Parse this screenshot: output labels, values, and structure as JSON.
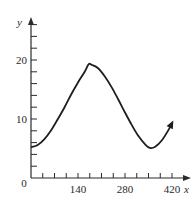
{
  "chart_data": {
    "type": "line",
    "title": "",
    "xlabel": "x",
    "ylabel": "y",
    "xlim": [
      0,
      440
    ],
    "ylim": [
      0,
      27
    ],
    "x_tick_labels": [
      "0",
      "140",
      "280",
      "420"
    ],
    "x_tick_label_values": [
      0,
      140,
      280,
      420
    ],
    "x_minor_tick_step": 35,
    "y_tick_labels": [
      "0",
      "10",
      "20"
    ],
    "y_tick_label_values": [
      0,
      10,
      20
    ],
    "y_minor_tick_step": 2,
    "grid": false,
    "legend": null,
    "annotations": [
      "curve ends with arrowhead"
    ],
    "series": [
      {
        "name": "y",
        "x": [
          0,
          20,
          40,
          60,
          80,
          100,
          120,
          140,
          160,
          172,
          180,
          200,
          220,
          240,
          260,
          280,
          300,
          320,
          340,
          354,
          370,
          390,
          410,
          420
        ],
        "values": [
          5.2,
          5.6,
          6.6,
          8.1,
          10.0,
          12.0,
          14.2,
          16.2,
          18.0,
          19.3,
          19.2,
          18.6,
          17.2,
          15.4,
          13.3,
          11.1,
          9.0,
          7.1,
          5.7,
          5.1,
          5.3,
          6.4,
          8.2,
          9.3
        ]
      }
    ]
  }
}
